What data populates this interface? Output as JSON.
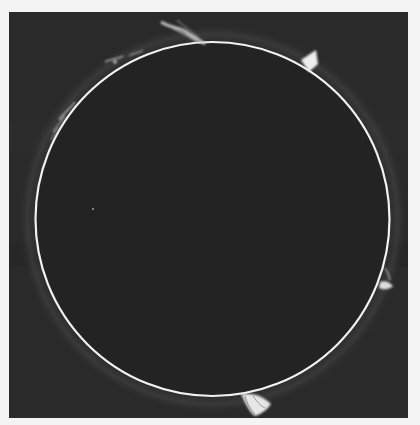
{
  "image": {
    "subject": "Solar disk with limb prominences (H-alpha style photograph)",
    "background_color": "#f4f4f4",
    "frame_color": "#2a2a2a",
    "limb_color": "#f2f2f2",
    "disk_color": "#232323",
    "disk": {
      "cx": 203.5,
      "cy": 207,
      "r": 177
    },
    "prominences": [
      {
        "position": "top",
        "description": "wispy prominence near top of limb"
      },
      {
        "position": "upper-right",
        "description": "bright pointed prominence"
      },
      {
        "position": "upper-left",
        "description": "faint scattered loops"
      },
      {
        "position": "left",
        "description": "faint arcs along limb"
      },
      {
        "position": "right",
        "description": "small bright prominence"
      },
      {
        "position": "bottom",
        "description": "bright looped prominence"
      }
    ]
  }
}
